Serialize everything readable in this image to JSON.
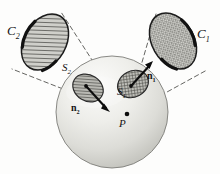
{
  "figure": {
    "background_color": "#fdfdfc",
    "ink_color": "#141414",
    "sphere": {
      "name": "sphere",
      "center_x": 112,
      "center_y": 112,
      "radius": 56,
      "fill_light": "#f2f2ef",
      "fill_dark": "#c9c9c4",
      "stroke": "#6e6e6e"
    },
    "point": {
      "label": "P",
      "x": 127,
      "y": 114,
      "dot_radius": 2.2
    },
    "patches": [
      {
        "id": "S1",
        "label": "S",
        "subscript": "1",
        "center_x": 133,
        "center_y": 84,
        "rx": 16,
        "ry": 13,
        "rotation": -28,
        "fill_pattern": "crosshatch",
        "fill_color": "#9c9c97",
        "stroke": "#2b2b2b"
      },
      {
        "id": "S2",
        "label": "S",
        "subscript": "2",
        "center_x": 88,
        "center_y": 88,
        "rx": 16,
        "ry": 13,
        "rotation": 32,
        "fill_pattern": "diagonal-hatch",
        "fill_color": "#8f8f8a",
        "stroke": "#2b2b2b"
      }
    ],
    "normals": [
      {
        "id": "n1",
        "label": "n",
        "subscript": "1",
        "from_x": 133,
        "from_y": 84,
        "to_x": 152,
        "to_y": 63,
        "style": "bold-arrow"
      },
      {
        "id": "n2",
        "label": "n",
        "subscript": "2",
        "from_x": 88,
        "from_y": 88,
        "to_x": 108,
        "to_y": 110,
        "style": "bold-arrow"
      }
    ],
    "cross_sections": [
      {
        "id": "C1",
        "label": "C",
        "subscript": "1",
        "center_x": 173,
        "center_y": 41,
        "rx": 21,
        "ry": 30,
        "rotation": -30,
        "fill_pattern": "stipple",
        "fill_color": "#b9b9b4",
        "stroke": "#1b1b1b"
      },
      {
        "id": "C2",
        "label": "C",
        "subscript": "2",
        "center_x": 45,
        "center_y": 42,
        "rx": 21,
        "ry": 30,
        "rotation": 30,
        "fill_pattern": "diagonal-hatch",
        "fill_color": "#b3b3ae",
        "stroke": "#1b1b1b"
      }
    ],
    "cone_lines": [
      {
        "id": "cone-1-upper",
        "x1": 127,
        "y1": 114,
        "x2": 156,
        "y2": 14
      },
      {
        "id": "cone-1-lower",
        "x1": 127,
        "y1": 114,
        "x2": 206,
        "y2": 70
      },
      {
        "id": "cone-2-upper",
        "x1": 127,
        "y1": 114,
        "x2": 61,
        "y2": 12
      },
      {
        "id": "cone-2-lower",
        "x1": 127,
        "y1": 114,
        "x2": 13,
        "y2": 69
      }
    ],
    "labels": {
      "C1": {
        "base": "C",
        "sub": "1"
      },
      "C2": {
        "base": "C",
        "sub": "2"
      },
      "S1": {
        "base": "S",
        "sub": "1"
      },
      "S2": {
        "base": "S",
        "sub": "2"
      },
      "n1": {
        "base": "n",
        "sub": "1"
      },
      "n2": {
        "base": "n",
        "sub": "2"
      },
      "P": {
        "base": "P",
        "sub": ""
      }
    }
  }
}
